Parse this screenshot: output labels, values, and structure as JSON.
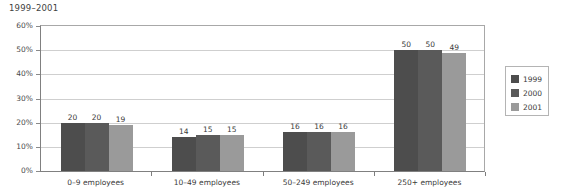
{
  "chart_data": {
    "type": "bar",
    "title": "1999–2001",
    "xlabel": "",
    "ylabel": "",
    "ylim": [
      0,
      60
    ],
    "ytick_labels": [
      "0%",
      "10%",
      "20%",
      "30%",
      "40%",
      "50%",
      "60%"
    ],
    "ytick_values": [
      0,
      10,
      20,
      30,
      40,
      50,
      60
    ],
    "grid": true,
    "legend_position": "right",
    "categories": [
      "0–9 employees",
      "10–49 employees",
      "50–249 employees",
      "250+ employees"
    ],
    "series": [
      {
        "name": "1999",
        "color": "#4d4d4d",
        "values": [
          20,
          14,
          16,
          50
        ]
      },
      {
        "name": "2000",
        "color": "#5a5a5a",
        "values": [
          20,
          15,
          16,
          50
        ]
      },
      {
        "name": "2001",
        "color": "#9a9a9a",
        "values": [
          19,
          15,
          16,
          49
        ]
      }
    ],
    "value_labels": [
      [
        "20",
        "20",
        "19"
      ],
      [
        "14",
        "15",
        "15"
      ],
      [
        "16",
        "16",
        "16"
      ],
      [
        "50",
        "50",
        "49"
      ]
    ]
  },
  "colors": {
    "background": "#ffffff",
    "axis": "#808080",
    "gridline": "#cfcfcf",
    "text": "#3a3a3a",
    "legend_border": "#b4b4b4"
  }
}
